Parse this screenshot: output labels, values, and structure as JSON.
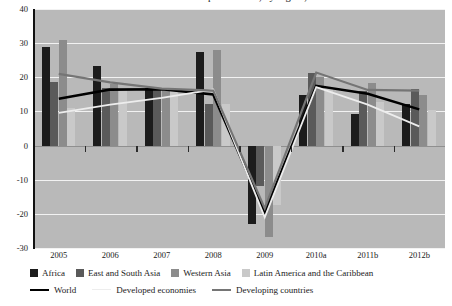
{
  "title": "Growth in merchandise export volume, by region, 2005-2012",
  "chart_data": {
    "type": "bar",
    "title": "Growth in merchandise export volume, by region, 2005-2012",
    "xlabel": "",
    "ylabel": "",
    "ylim": [
      -30,
      40
    ],
    "yticks": [
      40,
      30,
      20,
      10,
      0,
      -10,
      -20,
      -30
    ],
    "grid": true,
    "legend_position": "bottom",
    "categories": [
      "2005",
      "2006",
      "2007",
      "2008",
      "2009",
      "2010a",
      "2011b",
      "2012b"
    ],
    "series": [
      {
        "name": "Africa",
        "kind": "bar",
        "color": "#1c1c1c",
        "values": [
          28.8,
          23.2,
          16.8,
          27.3,
          -23.0,
          14.8,
          9.3,
          12.1
        ]
      },
      {
        "name": "East and South Asia",
        "kind": "bar",
        "color": "#5a5a5a",
        "values": [
          18.6,
          16.9,
          17.0,
          12.1,
          -11.9,
          21.4,
          16.0,
          16.6
        ]
      },
      {
        "name": "Western Asia",
        "kind": "bar",
        "color": "#8c8c8c",
        "values": [
          30.8,
          18.1,
          16.8,
          27.9,
          -26.8,
          20.0,
          18.2,
          14.8
        ]
      },
      {
        "name": "Latin America and the Caribbean",
        "kind": "bar",
        "color": "#c9c9c9",
        "values": [
          11.0,
          17.0,
          16.6,
          12.2,
          -17.3,
          17.0,
          12.8,
          10.4
        ]
      },
      {
        "name": "World",
        "kind": "line",
        "color": "#000000",
        "values": [
          13.7,
          16.4,
          16.5,
          15.0,
          -19.6,
          17.5,
          15.2,
          10.6
        ]
      },
      {
        "name": "Developed economies",
        "kind": "line",
        "color": "#ededed",
        "values": [
          9.6,
          12.0,
          14.0,
          16.4,
          -21.0,
          17.1,
          12.0,
          5.6
        ]
      },
      {
        "name": "Developing countries",
        "kind": "line",
        "color": "#757575",
        "values": [
          21.0,
          18.5,
          16.7,
          16.1,
          -18.4,
          21.4,
          16.3,
          16.1
        ]
      }
    ]
  },
  "axis": {
    "ytick_labels": [
      "40",
      "30",
      "20",
      "10",
      "0",
      "-10",
      "-20",
      "-30"
    ],
    "xtick_labels": [
      "2005",
      "2006",
      "2007",
      "2008",
      "2009",
      "2010a",
      "2011b",
      "2012b"
    ]
  },
  "legend": {
    "bars": [
      {
        "label": "Africa",
        "color": "#1c1c1c"
      },
      {
        "label": "East and South Asia",
        "color": "#5a5a5a"
      },
      {
        "label": "Western Asia",
        "color": "#8c8c8c"
      },
      {
        "label": "Latin America and the Caribbean",
        "color": "#c9c9c9"
      }
    ],
    "lines": [
      {
        "label": "World",
        "color": "#000000",
        "width": 2.6
      },
      {
        "label": "Developed economies",
        "color": "#ededed",
        "width": 1.8
      },
      {
        "label": "Developing countries",
        "color": "#757575",
        "width": 2.2
      }
    ]
  },
  "colors": {
    "plot_background": "#b9b9b9",
    "gridline": "#f2f2f2",
    "axis": "#111111"
  }
}
